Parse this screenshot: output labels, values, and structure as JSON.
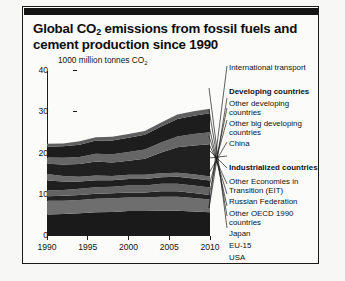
{
  "title": {
    "line1_pre": "Global CO",
    "line1_sub": "2",
    "line1_post": " emissions from fossil fuels and",
    "line2": "cement production since 1990"
  },
  "axis": {
    "unit_pre": "1000 million tonnes CO",
    "unit_sub": "2"
  },
  "source": "Source: Olivier & Peters \"No growth in total global CO₂ emissions in 2009\", Netherlands Environmental Assessment Agency, June 2010.",
  "legend": {
    "items": [
      {
        "label": "International transport",
        "bold": false
      },
      {
        "label": "Developing countries",
        "bold": true
      },
      {
        "label": "Other developing\ncountries",
        "bold": false
      },
      {
        "label": "Other big developing\ncountries",
        "bold": false
      },
      {
        "label": "China",
        "bold": false
      },
      {
        "label": "Industrialized countries",
        "bold": true
      },
      {
        "label": "Other Economies in\nTransition (EIT)",
        "bold": false
      },
      {
        "label": "Russian Federation",
        "bold": false
      },
      {
        "label": "Other OECD 1990\ncountries",
        "bold": false
      },
      {
        "label": "Japan",
        "bold": false
      },
      {
        "label": "EU-15",
        "bold": false
      },
      {
        "label": "USA",
        "bold": false
      }
    ]
  },
  "chart_data": {
    "type": "area",
    "title": "Global CO2 emissions from fossil fuels and cement production since 1990",
    "xlabel": "",
    "ylabel": "1000 million tonnes CO2",
    "ylim": [
      0,
      40
    ],
    "xlim": [
      1990,
      2010
    ],
    "yticks": [
      0,
      10,
      20,
      30,
      40
    ],
    "xticks": [
      1990,
      1995,
      2000,
      2005,
      2010
    ],
    "grid": false,
    "legend_position": "right",
    "stacked": true,
    "stack_order_bottom_to_top": [
      "USA",
      "EU-15",
      "Japan",
      "Other OECD 1990 countries",
      "Russian Federation",
      "Other Economies in Transition (EIT)",
      "China",
      "Other big developing countries",
      "Other developing countries",
      "International transport"
    ],
    "x": [
      1990,
      1992,
      1994,
      1996,
      1998,
      2000,
      2002,
      2004,
      2006,
      2008,
      2010
    ],
    "series": [
      {
        "name": "USA",
        "color": "#1a1a1a",
        "values": [
          5.0,
          5.1,
          5.3,
          5.5,
          5.6,
          5.8,
          5.8,
          5.9,
          5.9,
          5.7,
          5.5
        ]
      },
      {
        "name": "EU-15",
        "color": "#6e6e6e",
        "values": [
          3.3,
          3.2,
          3.2,
          3.3,
          3.3,
          3.3,
          3.3,
          3.4,
          3.4,
          3.3,
          3.1
        ]
      },
      {
        "name": "Japan",
        "color": "#242424",
        "values": [
          1.1,
          1.2,
          1.2,
          1.2,
          1.2,
          1.2,
          1.2,
          1.3,
          1.3,
          1.2,
          1.1
        ]
      },
      {
        "name": "Other OECD 1990 countries",
        "color": "#636363",
        "values": [
          1.4,
          1.4,
          1.5,
          1.6,
          1.6,
          1.7,
          1.7,
          1.8,
          1.8,
          1.8,
          1.8
        ]
      },
      {
        "name": "Russian Federation",
        "color": "#1f1f1f",
        "values": [
          2.4,
          2.1,
          1.8,
          1.7,
          1.6,
          1.6,
          1.6,
          1.6,
          1.7,
          1.7,
          1.7
        ]
      },
      {
        "name": "Other Economies in Transition (EIT)",
        "color": "#6b6b6b",
        "values": [
          1.6,
          1.3,
          1.1,
          1.1,
          1.0,
          1.0,
          1.0,
          1.0,
          1.0,
          1.0,
          1.0
        ]
      },
      {
        "name": "China",
        "color": "#202020",
        "values": [
          2.5,
          2.8,
          3.1,
          3.4,
          3.3,
          3.4,
          3.9,
          5.0,
          6.2,
          7.0,
          7.8
        ]
      },
      {
        "name": "Other big developing countries",
        "color": "#666666",
        "values": [
          1.5,
          1.6,
          1.7,
          1.9,
          2.0,
          2.1,
          2.2,
          2.4,
          2.6,
          2.8,
          2.9
        ]
      },
      {
        "name": "Other developing countries",
        "color": "#1d1d1d",
        "values": [
          2.6,
          2.8,
          3.0,
          3.2,
          3.3,
          3.5,
          3.6,
          3.9,
          4.2,
          4.4,
          4.6
        ]
      },
      {
        "name": "International transport",
        "color": "#5f5f5f",
        "values": [
          0.7,
          0.7,
          0.8,
          0.8,
          0.9,
          0.9,
          0.9,
          1.0,
          1.1,
          1.1,
          1.1
        ]
      }
    ]
  }
}
